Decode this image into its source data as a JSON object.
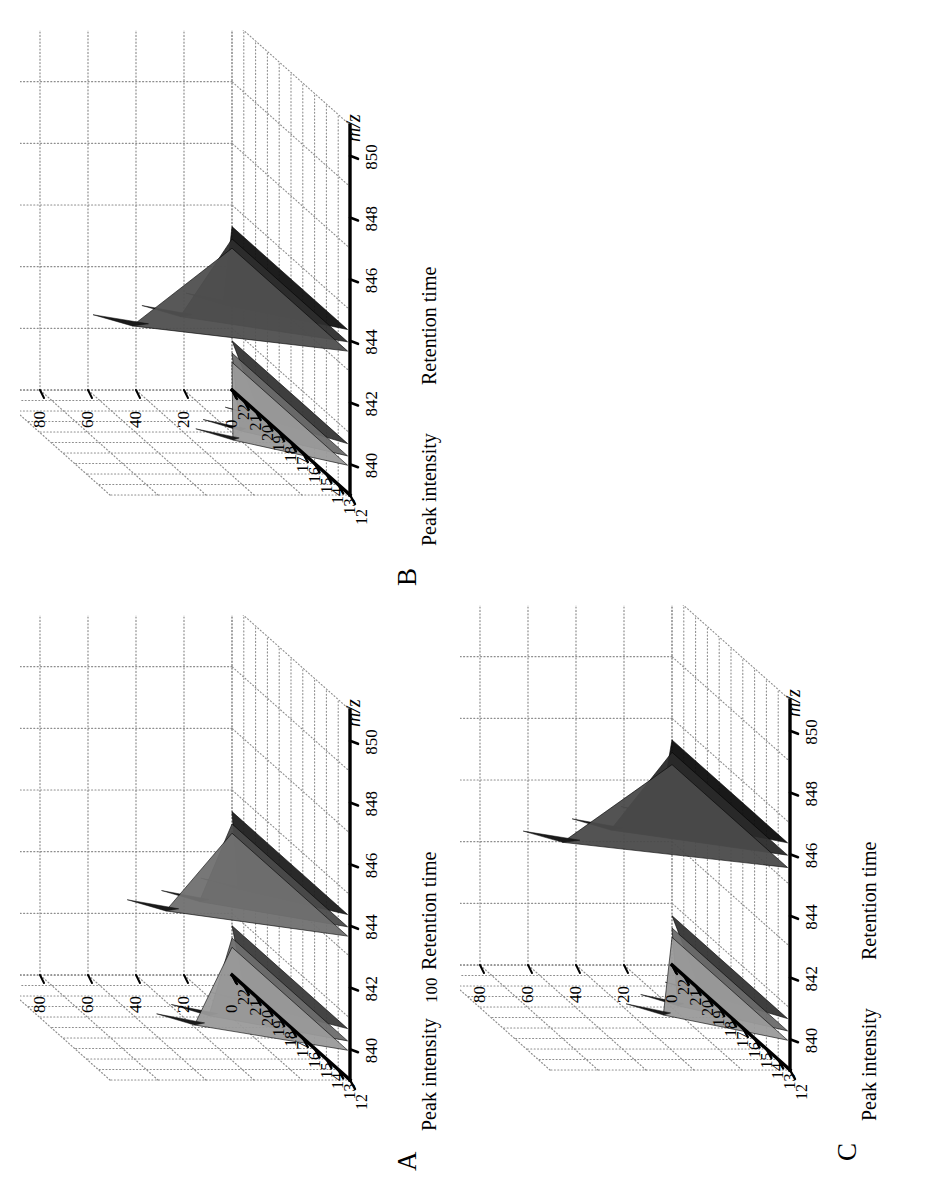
{
  "figure": {
    "orientation_deg": -90,
    "panels": [
      "A",
      "B",
      "C"
    ],
    "background": "#ffffff",
    "ink": "#000000",
    "grid_color": "#8d8d8d"
  },
  "labels": {
    "panel_a": "A",
    "panel_b": "B",
    "panel_c": "C",
    "z_axis_title": "Peak intensity",
    "y_axis_title": "Retention time",
    "x_axis_title": "m/z"
  },
  "axes": {
    "z_ticks": [
      "100",
      "80",
      "60",
      "40",
      "20",
      "0"
    ],
    "z_values": [
      100,
      80,
      60,
      40,
      20,
      0
    ],
    "y_ticks": [
      "22",
      "21",
      "20",
      "19",
      "18",
      "17",
      "16",
      "15",
      "14",
      "13",
      "12"
    ],
    "y_values": [
      22,
      21,
      20,
      19,
      18,
      17,
      16,
      15,
      14,
      13,
      12
    ],
    "x_ticks": [
      "840",
      "842",
      "844",
      "846",
      "848",
      "850"
    ],
    "x_values": [
      840,
      842,
      844,
      846,
      848,
      850
    ]
  },
  "chart_data": [
    {
      "id": "A",
      "type": "line",
      "title": "A",
      "xlabel": "m/z",
      "ylabel": "Retention time",
      "zlabel": "Peak intensity",
      "xlim": [
        839,
        851
      ],
      "ylim": [
        12,
        22
      ],
      "zlim": [
        0,
        100
      ],
      "grid": true,
      "legend": "none",
      "clusters": [
        {
          "name": "cluster-840",
          "mz_center": 840.2,
          "retention_time": 14.6,
          "traces": [
            {
              "mz": 839.9,
              "intensity": 52,
              "shade": "#9a9a9a"
            },
            {
              "mz": 840.2,
              "intensity": 46,
              "shade": "#6d6d6d"
            },
            {
              "mz": 840.6,
              "intensity": 30,
              "shade": "#3a3a3a"
            }
          ]
        },
        {
          "name": "cluster-844",
          "mz_center": 843.9,
          "retention_time": 14.6,
          "traces": [
            {
              "mz": 843.6,
              "intensity": 64,
              "shade": "#707070"
            },
            {
              "mz": 843.9,
              "intensity": 50,
              "shade": "#4a4a4a"
            },
            {
              "mz": 844.3,
              "intensity": 34,
              "shade": "#1e1e1e"
            }
          ]
        }
      ]
    },
    {
      "id": "B",
      "type": "line",
      "title": "B",
      "xlabel": "m/z",
      "ylabel": "Retention time",
      "zlabel": "Peak intensity",
      "xlim": [
        839,
        851
      ],
      "ylim": [
        12,
        22
      ],
      "zlim": [
        0,
        100
      ],
      "grid": true,
      "legend": "none",
      "clusters": [
        {
          "name": "cluster-840",
          "mz_center": 840.2,
          "retention_time": 14.6,
          "traces": [
            {
              "mz": 839.9,
              "intensity": 36,
              "shade": "#9a9a9a"
            },
            {
              "mz": 840.2,
              "intensity": 33,
              "shade": "#6a6a6a"
            },
            {
              "mz": 840.6,
              "intensity": 24,
              "shade": "#343434"
            }
          ]
        },
        {
          "name": "cluster-844",
          "mz_center": 843.9,
          "retention_time": 14.6,
          "traces": [
            {
              "mz": 843.6,
              "intensity": 78,
              "shade": "#4f4f4f"
            },
            {
              "mz": 843.9,
              "intensity": 58,
              "shade": "#2d2d2d"
            },
            {
              "mz": 844.3,
              "intensity": 40,
              "shade": "#111111"
            }
          ]
        }
      ]
    },
    {
      "id": "C",
      "type": "line",
      "title": "C",
      "xlabel": "m/z",
      "ylabel": "Retention time",
      "zlabel": "Peak intensity",
      "xlim": [
        839,
        851
      ],
      "ylim": [
        12,
        22
      ],
      "zlim": [
        0,
        100
      ],
      "grid": true,
      "legend": "none",
      "clusters": [
        {
          "name": "cluster-840",
          "mz_center": 840.2,
          "retention_time": 14.6,
          "traces": [
            {
              "mz": 839.9,
              "intensity": 40,
              "shade": "#9a9a9a"
            },
            {
              "mz": 840.2,
              "intensity": 34,
              "shade": "#6a6a6a"
            },
            {
              "mz": 840.6,
              "intensity": 24,
              "shade": "#343434"
            }
          ]
        },
        {
          "name": "cluster-846",
          "mz_center": 845.9,
          "retention_time": 14.6,
          "traces": [
            {
              "mz": 845.5,
              "intensity": 82,
              "shade": "#4a4a4a"
            },
            {
              "mz": 845.9,
              "intensity": 62,
              "shade": "#2a2a2a"
            },
            {
              "mz": 846.3,
              "intensity": 42,
              "shade": "#0d0d0d"
            }
          ]
        }
      ]
    }
  ]
}
